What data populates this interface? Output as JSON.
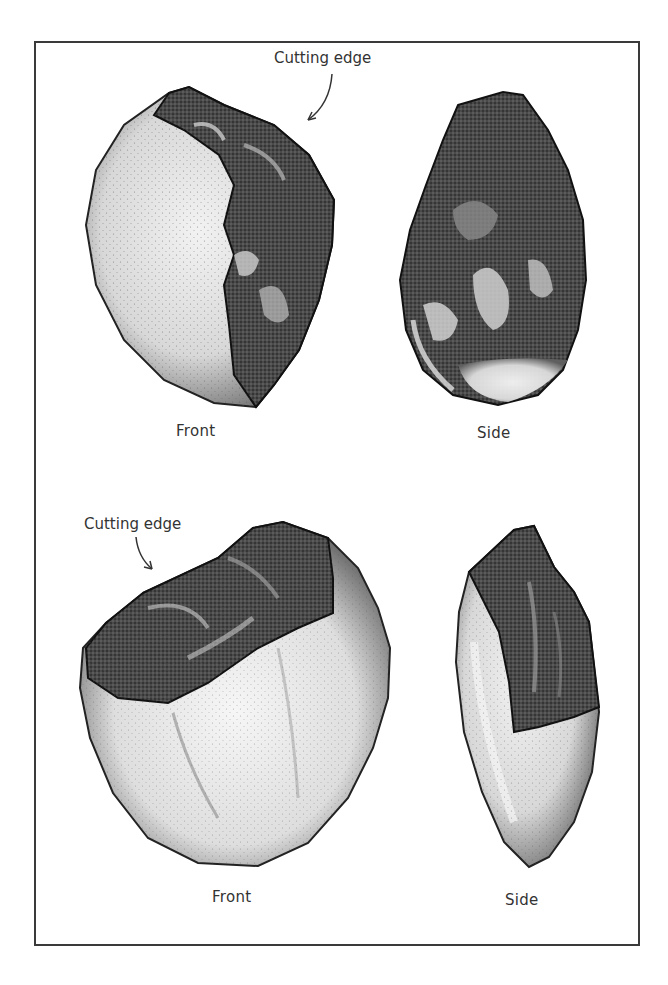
{
  "figure": {
    "title": "",
    "frame_color": "#3a3a3a",
    "panels": [
      {
        "id": "top",
        "callout": {
          "text": "Cutting edge",
          "icon": "curved-arrow-icon"
        },
        "views": [
          {
            "label": "Front",
            "tone_light": "#e4e4e4",
            "tone_dark": "#2a2a2a"
          },
          {
            "label": "Side",
            "tone_light": "#dcdcdc",
            "tone_dark": "#222222"
          }
        ]
      },
      {
        "id": "bottom",
        "callout": {
          "text": "Cutting edge",
          "icon": "curved-arrow-icon"
        },
        "views": [
          {
            "label": "Front",
            "tone_light": "#ececec",
            "tone_dark": "#333333"
          },
          {
            "label": "Side",
            "tone_light": "#e2e2e2",
            "tone_dark": "#2c2c2c"
          }
        ]
      }
    ]
  }
}
